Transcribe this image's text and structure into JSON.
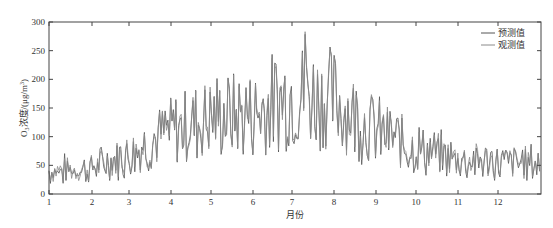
{
  "chart_data": {
    "type": "line",
    "title": "",
    "xlabel": "月份",
    "ylabel": "O3浓度/(μg/m3)",
    "ylabel_parts": {
      "main": "O",
      "sub": "3",
      "rest": "浓度/(μg/m",
      "sup": "3",
      "end": ")"
    },
    "xlim": [
      1,
      13
    ],
    "ylim": [
      0,
      300
    ],
    "x_ticks": [
      1,
      2,
      3,
      4,
      5,
      6,
      7,
      8,
      9,
      10,
      11,
      12
    ],
    "x_tick_labels": [
      "1",
      "2",
      "3",
      "4",
      "5",
      "6",
      "7",
      "8",
      "9",
      "10",
      "11",
      "12"
    ],
    "y_ticks": [
      0,
      50,
      100,
      150,
      200,
      250,
      300
    ],
    "y_tick_labels": [
      "0",
      "50",
      "100",
      "150",
      "200",
      "250",
      "300"
    ],
    "grid": false,
    "legend_position": "upper right",
    "legend": [
      "预测值",
      "观测值"
    ],
    "series": [
      {
        "name": "预测值",
        "color": "#555555"
      },
      {
        "name": "观测值",
        "color": "#8a8a8a"
      }
    ],
    "monthly_mean_approx": {
      "1": 40,
      "2": 45,
      "3": 70,
      "4": 110,
      "5": 135,
      "6": 140,
      "7": 175,
      "8": 165,
      "9": 110,
      "10": 80,
      "11": 60,
      "12": 55
    },
    "peak": {
      "month": 7.3,
      "value": 283
    },
    "month_pixel_x": [
      49,
      92,
      129,
      171,
      211,
      253,
      292,
      334,
      376,
      416,
      458,
      498,
      541
    ]
  }
}
